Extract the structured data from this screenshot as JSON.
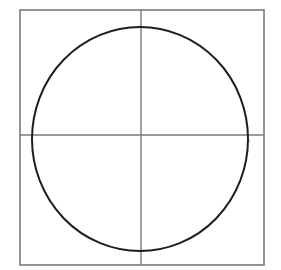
{
  "diagram": {
    "colors": {
      "background": "#ffffff",
      "frame": "#7a7a7a",
      "axes": "#7a7a7a",
      "circle": "#1e1e1e",
      "dot": "#555555"
    },
    "frame": {
      "x": 20,
      "y": 10,
      "width": 244,
      "height": 255
    },
    "axes": {
      "vertical_x": 141,
      "horizontal_y": 135
    },
    "circle": {
      "cx": 140,
      "cy": 139,
      "rx": 108,
      "ry": 112
    },
    "marker_dot": {
      "x": 249,
      "y": 141
    }
  }
}
